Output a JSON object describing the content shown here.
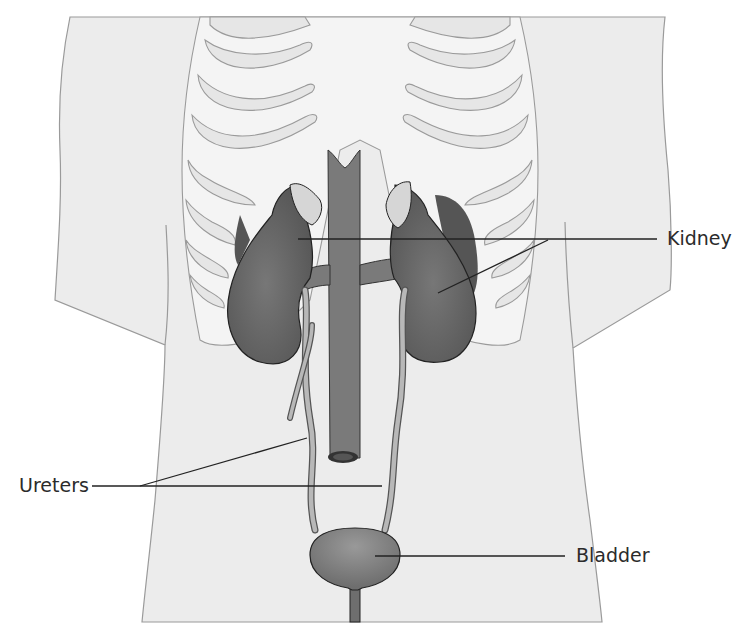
{
  "diagram": {
    "colors": {
      "body_fill": "#ececec",
      "body_stroke": "#9a9a9a",
      "rib_fill": "#f4f4f4",
      "organ_dark": "#5e5e5e",
      "vessel": "#7a7a7a",
      "ureter": "#b8b8b8",
      "adrenal": "#d6d6d6",
      "leader_line": "#222222",
      "label_text": "#2b2b2b"
    },
    "labels": {
      "kidney": "Kidney",
      "ureters": "Ureters",
      "bladder": "Bladder"
    }
  }
}
